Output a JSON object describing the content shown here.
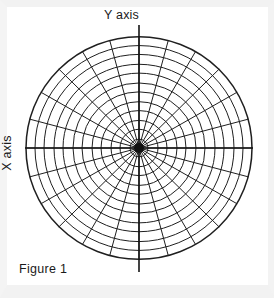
{
  "figure": {
    "caption": "Figure 1",
    "y_axis_label": "Y axis",
    "x_axis_label": "X axis",
    "background_color": "#ffffff",
    "ink_color": "#1a1a1a"
  },
  "chart_data": {
    "type": "polar-grid",
    "title": "Figure 1",
    "xlabel": "X axis",
    "ylabel": "Y axis",
    "grid": true,
    "legend": "none",
    "center": {
      "x": 139,
      "y": 148
    },
    "outer_radius": 113,
    "ring_count": 12,
    "ring_radii": [
      9,
      19,
      28,
      38,
      47,
      57,
      66,
      76,
      85,
      95,
      104,
      113
    ],
    "spoke_count": 24,
    "spoke_angle_step_degrees": 15,
    "spoke_angles_degrees": [
      0,
      15,
      30,
      45,
      60,
      75,
      90,
      105,
      120,
      135,
      150,
      165,
      180,
      195,
      210,
      225,
      240,
      255,
      270,
      285,
      300,
      315,
      330,
      345
    ],
    "axes": {
      "x_axis_extent": {
        "x1": 25,
        "x2": 253,
        "y": 148
      },
      "y_axis_extent": {
        "y1": 25,
        "y2": 272,
        "x": 139
      }
    },
    "hub": {
      "description": "dense black blob where spokes converge",
      "radius": 5,
      "color": "#111111"
    },
    "stroke_color": "#1f1f1f",
    "stroke_width": 1
  }
}
